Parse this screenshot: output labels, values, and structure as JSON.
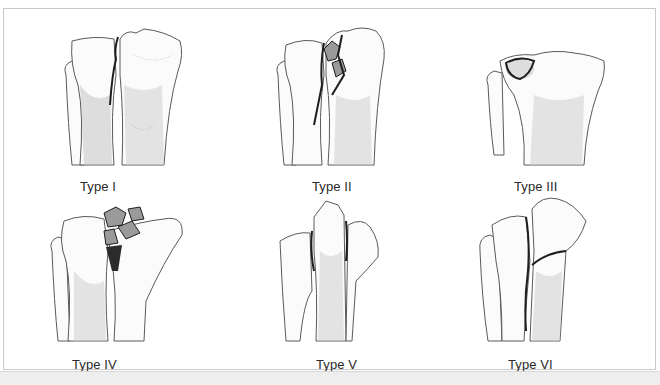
{
  "figure": {
    "panels": [
      {
        "label": "Type I",
        "description": "Split fracture of lateral plateau"
      },
      {
        "label": "Type II",
        "description": "Split-depression fracture of lateral plateau"
      },
      {
        "label": "Type III",
        "description": "Pure depression of lateral plateau"
      },
      {
        "label": "Type IV",
        "description": "Medial plateau fracture"
      },
      {
        "label": "Type V",
        "description": "Bicondylar fracture"
      },
      {
        "label": "Type VI",
        "description": "Plateau fracture with metaphyseal-diaphyseal dissociation"
      }
    ]
  },
  "colors": {
    "border": "#c8c8c8",
    "background": "#ffffff",
    "bottom_strip": "#eeeeee",
    "ink": "#2a2a2a"
  }
}
